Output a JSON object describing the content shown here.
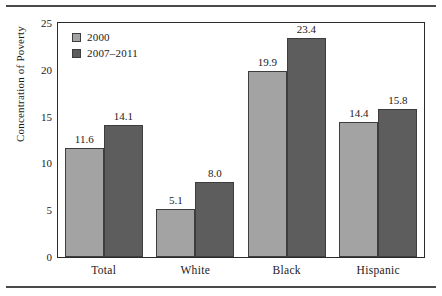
{
  "chart_data": {
    "type": "bar",
    "title": "",
    "subtitle": "",
    "xlabel": "",
    "ylabel": "Concentration of Poverty",
    "categories": [
      "Total",
      "White",
      "Black",
      "Hispanic"
    ],
    "series": [
      {
        "name": "2000",
        "values": [
          11.6,
          5.1,
          19.9,
          14.4
        ],
        "color": "#a3a3a3"
      },
      {
        "name": "2007–2011",
        "values": [
          14.1,
          8.0,
          23.4,
          15.8
        ],
        "color": "#5d5d5d"
      }
    ],
    "value_labels": [
      [
        "11.6",
        "5.1",
        "19.9",
        "14.4"
      ],
      [
        "14.1",
        "8.0",
        "23.4",
        "15.8"
      ]
    ],
    "ylim": [
      0,
      25
    ],
    "yticks": [
      0,
      5,
      10,
      15,
      20,
      25
    ],
    "ytick_labels": [
      "0",
      "5",
      "10",
      "15",
      "20",
      "25"
    ],
    "grid": false,
    "legend_position": "top-left",
    "frame": true
  },
  "legend": {
    "entries": [
      {
        "label": "2000"
      },
      {
        "label": "2007–2011"
      }
    ]
  },
  "axis": {
    "y_title": "Concentration of Poverty"
  }
}
